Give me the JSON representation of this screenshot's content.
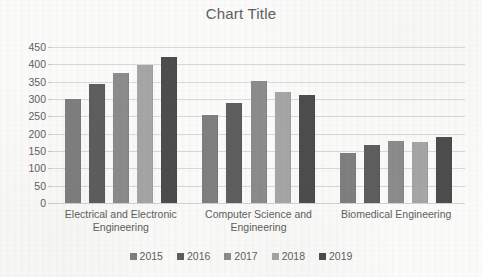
{
  "chart_data": {
    "type": "bar",
    "title": "Chart Title",
    "xlabel": "",
    "ylabel": "",
    "ylim": [
      0,
      450
    ],
    "y_ticks": [
      0,
      50,
      100,
      150,
      200,
      250,
      300,
      350,
      400,
      450
    ],
    "grid": true,
    "legend_position": "bottom",
    "categories": [
      "Electrical and Electronic Engineering",
      "Computer Science and Engineering",
      "Biomedical Engineering"
    ],
    "series": [
      {
        "name": "2015",
        "color": "#7f7f7f",
        "values": [
          300,
          255,
          145
        ]
      },
      {
        "name": "2016",
        "color": "#5e5e5e",
        "values": [
          342,
          288,
          167
        ]
      },
      {
        "name": "2017",
        "color": "#8c8c8c",
        "values": [
          375,
          353,
          180
        ]
      },
      {
        "name": "2018",
        "color": "#a6a6a6",
        "values": [
          397,
          320,
          175
        ]
      },
      {
        "name": "2019",
        "color": "#4d4d4d",
        "values": [
          420,
          312,
          190
        ]
      }
    ]
  },
  "colors": {
    "background": "#fbfbf9",
    "gridline": "#d9d9d9",
    "text": "#5f5f5f",
    "title": "#606060"
  }
}
